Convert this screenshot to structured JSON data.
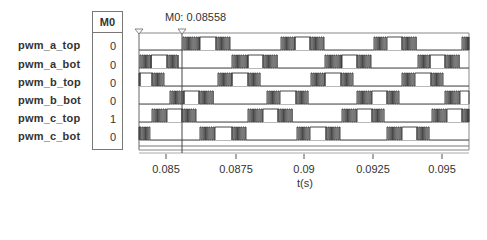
{
  "chart_data": {
    "type": "line",
    "subtype": "digital-timing-diagram",
    "title": "",
    "xlabel": "t(s)",
    "ylabel": "",
    "xlim": [
      0.08422,
      0.096
    ],
    "x_ticks": [
      0.085,
      0.0875,
      0.09,
      0.0925,
      0.095
    ],
    "x_tick_labels": [
      "0.085",
      "0.0875",
      "0.09",
      "0.0925",
      "0.095"
    ],
    "grid": false,
    "legend": "none",
    "cursor": {
      "name": "M0",
      "x": 0.08558,
      "label": "M0: 0.08558"
    },
    "series": [
      {
        "name": "pwm_a_top",
        "value_at_cursor": 0
      },
      {
        "name": "pwm_a_bot",
        "value_at_cursor": 0
      },
      {
        "name": "pwm_b_top",
        "value_at_cursor": 0
      },
      {
        "name": "pwm_b_bot",
        "value_at_cursor": 0
      },
      {
        "name": "pwm_c_top",
        "value_at_cursor": 1
      },
      {
        "name": "pwm_c_bot",
        "value_at_cursor": 0
      }
    ]
  },
  "table": {
    "header": "M0",
    "rows": [
      {
        "signal": "pwm_a_top",
        "value": "0"
      },
      {
        "signal": "pwm_a_bot",
        "value": "0"
      },
      {
        "signal": "pwm_b_top",
        "value": "0"
      },
      {
        "signal": "pwm_b_bot",
        "value": "0"
      },
      {
        "signal": "pwm_c_top",
        "value": "1"
      },
      {
        "signal": "pwm_c_bot",
        "value": "0"
      }
    ]
  },
  "marker": {
    "label": "M0: 0.08558"
  },
  "axis": {
    "ticks": [
      {
        "label": "0.085",
        "x": 166
      },
      {
        "label": "0.0875",
        "x": 236
      },
      {
        "label": "0.09",
        "x": 304
      },
      {
        "label": "0.0925",
        "x": 373
      },
      {
        "label": "0.095",
        "x": 442
      }
    ],
    "xlabel": "t(s)"
  },
  "colors": {
    "trace": "#333333",
    "frame": "#777777",
    "background": "#ffffff"
  },
  "waveforms": [
    {
      "name": "pwm_a_top",
      "pulses": [
        [
          183,
          200,
          216,
          230
        ],
        [
          281,
          295,
          310,
          324
        ],
        [
          374,
          387,
          402,
          417
        ],
        [
          462,
          469,
          469,
          469
        ]
      ]
    },
    {
      "name": "pwm_a_bot",
      "pulses": [
        [
          140,
          151,
          167,
          178
        ],
        [
          232,
          248,
          263,
          278
        ],
        [
          325,
          342,
          357,
          371
        ],
        [
          418,
          430,
          445,
          460
        ]
      ]
    },
    {
      "name": "pwm_b_top",
      "pulses": [
        [
          136,
          140,
          152,
          164
        ],
        [
          218,
          232,
          248,
          261
        ],
        [
          311,
          325,
          341,
          353
        ],
        [
          402,
          415,
          431,
          443
        ]
      ]
    },
    {
      "name": "pwm_b_bot",
      "pulses": [
        [
          170,
          184,
          199,
          214
        ],
        [
          267,
          280,
          296,
          309
        ],
        [
          357,
          372,
          387,
          399
        ],
        [
          445,
          460,
          469,
          469
        ]
      ]
    },
    {
      "name": "pwm_c_top",
      "pulses": [
        [
          152,
          167,
          182,
          196
        ],
        [
          248,
          263,
          278,
          293
        ],
        [
          342,
          357,
          372,
          385
        ],
        [
          432,
          447,
          462,
          469
        ]
      ]
    },
    {
      "name": "pwm_c_bot",
      "pulses": [
        [
          136,
          136,
          140,
          150
        ],
        [
          200,
          215,
          232,
          246
        ],
        [
          297,
          310,
          326,
          340
        ],
        [
          387,
          402,
          417,
          430
        ]
      ]
    }
  ]
}
